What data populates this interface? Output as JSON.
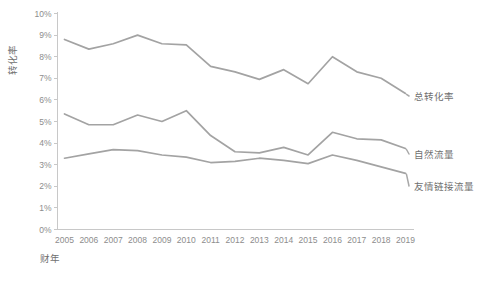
{
  "chart_data": {
    "type": "line",
    "title": "",
    "xlabel": "财年",
    "ylabel": "转化率",
    "categories": [
      "2005",
      "2006",
      "2007",
      "2008",
      "2009",
      "2010",
      "2011",
      "2012",
      "2013",
      "2014",
      "2015",
      "2016",
      "2017",
      "2018",
      "2019"
    ],
    "x": [
      2005,
      2006,
      2007,
      2008,
      2009,
      2010,
      2011,
      2012,
      2013,
      2014,
      2015,
      2016,
      2017,
      2018,
      2019
    ],
    "ylim": [
      0,
      10
    ],
    "xlim": [
      2005,
      2019
    ],
    "ytick_labels": [
      "0%",
      "1%",
      "2%",
      "3%",
      "4%",
      "5%",
      "6%",
      "7%",
      "8%",
      "9%",
      "10%"
    ],
    "ytick_values": [
      0,
      1,
      2,
      3,
      4,
      5,
      6,
      7,
      8,
      9,
      10
    ],
    "grid": false,
    "legend_position": "right-inline-labels",
    "series": [
      {
        "name": "总转化率",
        "color": "#a3a3a3",
        "values": [
          8.8,
          8.35,
          8.6,
          9.0,
          8.6,
          8.55,
          7.55,
          7.3,
          6.95,
          7.4,
          6.75,
          8.0,
          7.3,
          7.0,
          6.3
        ]
      },
      {
        "name": "自然流量",
        "color": "#a3a3a3",
        "values": [
          5.35,
          4.85,
          4.85,
          5.3,
          5.0,
          5.5,
          4.35,
          3.6,
          3.55,
          3.8,
          3.45,
          4.5,
          4.2,
          4.15,
          3.75
        ]
      },
      {
        "name": "友情链接流量",
        "color": "#a3a3a3",
        "values": [
          3.3,
          3.5,
          3.7,
          3.65,
          3.45,
          3.35,
          3.1,
          3.15,
          3.3,
          3.2,
          3.05,
          3.45,
          3.2,
          2.9,
          2.6
        ]
      }
    ]
  },
  "axis": {
    "y_title": "转化率",
    "x_title": "财年"
  },
  "series_labels": {
    "total": "总转化率",
    "organic": "自然流量",
    "referral": "友情链接流量"
  },
  "colors": {
    "line": "#a3a3a3",
    "axis": "#c8c8c8",
    "text": "#7b7b7b",
    "background": "#ffffff"
  }
}
